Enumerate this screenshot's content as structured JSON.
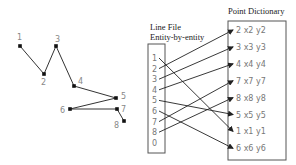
{
  "diagram": {
    "polyline_points": [
      {
        "label": "1",
        "x": 20,
        "y": 46,
        "lx": 17,
        "ly": 40
      },
      {
        "label": "2",
        "x": 44,
        "y": 74,
        "lx": 41,
        "ly": 85
      },
      {
        "label": "3",
        "x": 56,
        "y": 46,
        "lx": 55,
        "ly": 42
      },
      {
        "label": "4",
        "x": 74,
        "y": 86,
        "lx": 78,
        "ly": 84
      },
      {
        "label": "5",
        "x": 116,
        "y": 98,
        "lx": 121,
        "ly": 99
      },
      {
        "label": "6",
        "x": 70,
        "y": 109,
        "lx": 60,
        "ly": 113
      },
      {
        "label": "7",
        "x": 117,
        "y": 109,
        "lx": 121,
        "ly": 112
      },
      {
        "label": "8",
        "x": 124,
        "y": 121,
        "lx": 114,
        "ly": 128
      }
    ],
    "line_file": {
      "title_line1": "Line File",
      "title_line2": "Entity-by-entity",
      "entries": [
        "1",
        "2",
        "3",
        "4",
        "5",
        "6",
        "7",
        "8",
        "0"
      ]
    },
    "point_dictionary": {
      "title": "Point Dictionary",
      "rows": [
        "2  x2 y2",
        "3  x3 y3",
        "4  x4 y4",
        "7  x7 y7",
        "8  x8 y8",
        "5  x5 y5",
        "1  x1 y1",
        "6  x6 y6"
      ]
    },
    "links": [
      {
        "from_entry": "1",
        "to_row": 6
      },
      {
        "from_entry": "2",
        "to_row": 0
      },
      {
        "from_entry": "3",
        "to_row": 1
      },
      {
        "from_entry": "4",
        "to_row": 2
      },
      {
        "from_entry": "5",
        "to_row": 5
      },
      {
        "from_entry": "6",
        "to_row": 7
      },
      {
        "from_entry": "7",
        "to_row": 3
      },
      {
        "from_entry": "8",
        "to_row": 4
      }
    ]
  }
}
